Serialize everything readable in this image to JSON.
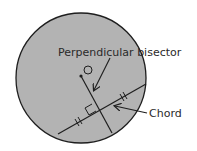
{
  "diagram": {
    "type": "geometry",
    "colors": {
      "circle_fill": "#b3b3b3",
      "stroke": "#1e1e1e",
      "background": "#ffffff",
      "text": "#2a2a2a"
    },
    "circle": {
      "cx": 81,
      "cy": 78,
      "r": 65
    },
    "center_mark": {
      "label": "O",
      "cx": 88,
      "cy": 70,
      "r": 4
    },
    "center_point": {
      "cx": 81,
      "cy": 76
    },
    "chord": {
      "x1": 58,
      "y1": 134,
      "x2": 146,
      "y2": 84
    },
    "bisector": {
      "x1": 81,
      "y1": 76,
      "x2": 112,
      "y2": 133
    },
    "labels": {
      "bisector": "Perpendicular bisector",
      "chord": "Chord"
    }
  }
}
